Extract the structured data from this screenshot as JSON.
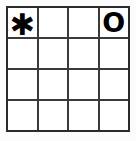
{
  "puzzle": {
    "type": "grid-puzzle",
    "rows": 4,
    "columns": 4,
    "background_color": "#fcfcfc",
    "cell_color": "#ffffff",
    "line_color": "#3a3a3a",
    "border_color": "#2b2b2b",
    "glyph_color": "#000000",
    "cells": [
      {
        "row": 1,
        "column": 1,
        "value": "✱",
        "glyph_name": "asterisk-glyph",
        "empty": false
      },
      {
        "row": 1,
        "column": 2,
        "value": "",
        "glyph_name": "empty-cell",
        "empty": true
      },
      {
        "row": 1,
        "column": 3,
        "value": "",
        "glyph_name": "empty-cell",
        "empty": true
      },
      {
        "row": 1,
        "column": 4,
        "value": "O",
        "glyph_name": "letter-o-glyph",
        "empty": false
      },
      {
        "row": 2,
        "column": 1,
        "value": "",
        "glyph_name": "empty-cell",
        "empty": true
      },
      {
        "row": 2,
        "column": 2,
        "value": "",
        "glyph_name": "empty-cell",
        "empty": true
      },
      {
        "row": 2,
        "column": 3,
        "value": "",
        "glyph_name": "empty-cell",
        "empty": true
      },
      {
        "row": 2,
        "column": 4,
        "value": "",
        "glyph_name": "empty-cell",
        "empty": true
      },
      {
        "row": 3,
        "column": 1,
        "value": "",
        "glyph_name": "empty-cell",
        "empty": true
      },
      {
        "row": 3,
        "column": 2,
        "value": "",
        "glyph_name": "empty-cell",
        "empty": true
      },
      {
        "row": 3,
        "column": 3,
        "value": "",
        "glyph_name": "empty-cell",
        "empty": true
      },
      {
        "row": 3,
        "column": 4,
        "value": "",
        "glyph_name": "empty-cell",
        "empty": true
      },
      {
        "row": 4,
        "column": 1,
        "value": "",
        "glyph_name": "empty-cell",
        "empty": true
      },
      {
        "row": 4,
        "column": 2,
        "value": "",
        "glyph_name": "empty-cell",
        "empty": true
      },
      {
        "row": 4,
        "column": 3,
        "value": "",
        "glyph_name": "empty-cell",
        "empty": true
      },
      {
        "row": 4,
        "column": 4,
        "value": "",
        "glyph_name": "empty-cell",
        "empty": true
      }
    ]
  }
}
